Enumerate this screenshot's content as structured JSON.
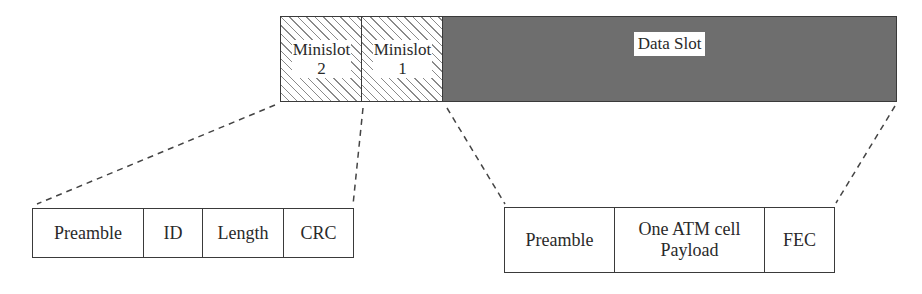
{
  "top_frame": {
    "minislot_2": "Minislot 2",
    "minislot_2_line1": "Minislot",
    "minislot_2_line2": "2",
    "minislot_1_line1": "Minislot",
    "minislot_1_line2": "1",
    "data_slot": "Data Slot"
  },
  "minislot_detail": {
    "fields": [
      "Preamble",
      "ID",
      "Length",
      "CRC"
    ]
  },
  "data_slot_detail": {
    "fields": [
      "Preamble",
      "One ATM cell Payload",
      "FEC"
    ],
    "payload_line1": "One ATM cell",
    "payload_line2": "Payload"
  },
  "colors": {
    "data_slot_fill": "#6e6e6e",
    "hatch": "#8a8a8a",
    "border": "#3a3a3a"
  }
}
